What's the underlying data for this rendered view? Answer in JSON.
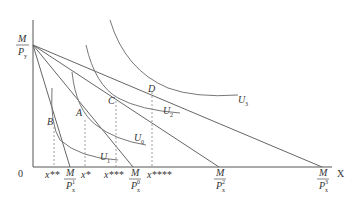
{
  "diagram": {
    "type": "consumer-choice-indifference-curves",
    "axes": {
      "origin_label": "0",
      "x_label": "X",
      "y_intercept": {
        "num": "M",
        "den": "P",
        "den_sub": "y"
      }
    },
    "points": [
      {
        "id": "A",
        "label": "A"
      },
      {
        "id": "B",
        "label": "B"
      },
      {
        "id": "C",
        "label": "C"
      },
      {
        "id": "D",
        "label": "D"
      }
    ],
    "indifference_curves": [
      {
        "label": "U",
        "sub": "0"
      },
      {
        "label": "U",
        "sub": "1"
      },
      {
        "label": "U",
        "sub": "2"
      },
      {
        "label": "U",
        "sub": "3"
      }
    ],
    "x_ticks": [
      {
        "label": "x**"
      },
      {
        "num": "M",
        "den": "P",
        "den_sub": "x",
        "den_sup": "1"
      },
      {
        "label": "x*"
      },
      {
        "label": "x***"
      },
      {
        "num": "M",
        "den": "P",
        "den_sub": "x",
        "den_sup": "0"
      },
      {
        "label": "x****"
      },
      {
        "num": "M",
        "den": "P",
        "den_sub": "x",
        "den_sup": "2"
      },
      {
        "num": "M",
        "den": "P",
        "den_sub": "x",
        "den_sup": "3"
      }
    ]
  }
}
